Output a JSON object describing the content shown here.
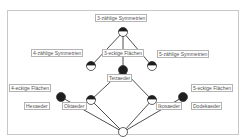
{
  "diagram": {
    "type": "concept-lattice",
    "colors": {
      "edge": "#3a3a3a",
      "node_fill_dark": "#1e1e1e",
      "node_fill_light": "#ffffff",
      "label_border": "#b4b4b4",
      "label_text": "#555555",
      "frame": "#c8c8c8"
    },
    "attribute_labels": {
      "top": "3-zählige Symmetrien",
      "left": "4-zählige Symmetrien",
      "center": "3-eckige Flächen",
      "right": "5-zählige Symmetrien",
      "four_faces": "4-eckige Flächen",
      "five_faces": "5-eckige Flächen"
    },
    "object_labels": {
      "tetraeder": "Tetraeder",
      "hexaeder": "Hexaeder",
      "oktaeder": "Oktaeder",
      "ikosaeder": "Ikosaeder",
      "dodekaeder": "Dodekaeder"
    },
    "nodes": [
      {
        "id": "top",
        "x": 123,
        "y": 32,
        "style": "half"
      },
      {
        "id": "sym4",
        "x": 91,
        "y": 66,
        "style": "half"
      },
      {
        "id": "tetra",
        "x": 123,
        "y": 70,
        "style": "full"
      },
      {
        "id": "sym5",
        "x": 152,
        "y": 66,
        "style": "half"
      },
      {
        "id": "hexa",
        "x": 61,
        "y": 97,
        "style": "full"
      },
      {
        "id": "okta",
        "x": 91,
        "y": 100,
        "style": "half"
      },
      {
        "id": "ikosa",
        "x": 152,
        "y": 100,
        "style": "half"
      },
      {
        "id": "dodeka",
        "x": 183,
        "y": 97,
        "style": "full"
      },
      {
        "id": "bottom",
        "x": 123,
        "y": 132,
        "style": "empty"
      }
    ],
    "edges": [
      [
        "top",
        "sym4"
      ],
      [
        "top",
        "tetra"
      ],
      [
        "top",
        "sym5"
      ],
      [
        "tetra",
        "okta"
      ],
      [
        "tetra",
        "ikosa"
      ],
      [
        "okta",
        "bottom"
      ],
      [
        "ikosa",
        "bottom"
      ],
      [
        "hexa",
        "bottom"
      ],
      [
        "dodeka",
        "bottom"
      ]
    ]
  }
}
